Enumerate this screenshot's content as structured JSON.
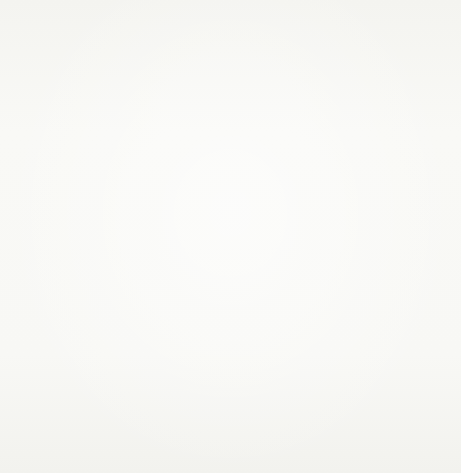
{
  "title": "Histogram",
  "axes": {
    "x_label": "Time (s)",
    "y_label": "Frequency density",
    "origin_label": "O",
    "x_ticks": [
      {
        "value": 20,
        "label": "20"
      },
      {
        "value": 40,
        "label": "40"
      },
      {
        "value": 60,
        "label": "60"
      },
      {
        "value": 80,
        "label": "80"
      },
      {
        "value": 100,
        "label": "100"
      }
    ],
    "y_ticks": [
      {
        "value": 1.0,
        "label": "1"
      },
      {
        "value": 0.8,
        "label": "0.8"
      },
      {
        "value": 0.6,
        "label": "0.6"
      },
      {
        "value": 0.4,
        "label": "0.4"
      },
      {
        "value": 0.2,
        "label": "0.2"
      },
      {
        "value": 0.0,
        "label": "0"
      }
    ]
  },
  "colors": {
    "bar_fill": "#f3c4de",
    "bar_stroke": "#9c4a78",
    "grid_major": "#42cfe4",
    "grid_minor": "#9fe8f2",
    "axis": "#1a1a1e",
    "background": "#f7f7f4"
  },
  "chart_data": {
    "type": "bar",
    "title": "Histogram",
    "xlabel": "Time (s)",
    "ylabel": "Frequency density",
    "xlim": [
      0,
      110
    ],
    "ylim": [
      0,
      1.12
    ],
    "grid": true,
    "legend": "none",
    "bin_edges": [
      0,
      10,
      20,
      30,
      40,
      50,
      100
    ],
    "categories": [
      "0-10",
      "10-20",
      "20-30",
      "30-40",
      "40-50",
      "50-100"
    ],
    "values": [
      1,
      0.8,
      0.5,
      0.4,
      0.2,
      0.05
    ],
    "bars": [
      {
        "x_start": 0,
        "x_end": 10,
        "density": 1,
        "frequency": 10
      },
      {
        "x_start": 10,
        "x_end": 20,
        "density": 0.8,
        "frequency": 8
      },
      {
        "x_start": 20,
        "x_end": 30,
        "density": 0.5,
        "frequency": 5
      },
      {
        "x_start": 30,
        "x_end": 40,
        "density": 0.4,
        "frequency": 4
      },
      {
        "x_start": 40,
        "x_end": 50,
        "density": 0.2,
        "frequency": 2
      },
      {
        "x_start": 50,
        "x_end": 100,
        "density": 0.05,
        "frequency": 2.5
      }
    ]
  }
}
